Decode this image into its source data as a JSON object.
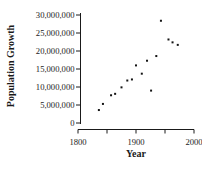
{
  "figure": {
    "background_color": "#ffffff",
    "axis_color": "#1a1a1a",
    "point_color": "#141414"
  },
  "chart_data": {
    "type": "scatter",
    "title": "",
    "xlabel": "Year",
    "ylabel": "Population Growth",
    "xlim": [
      1800,
      2000
    ],
    "ylim": [
      0,
      30000000
    ],
    "grid": false,
    "legend": false,
    "y_ticks": [
      {
        "value": 0,
        "label": "0"
      },
      {
        "value": 5000000,
        "label": "5,000,000"
      },
      {
        "value": 10000000,
        "label": "10,000,000"
      },
      {
        "value": 15000000,
        "label": "15,000,000"
      },
      {
        "value": 20000000,
        "label": "20,000,000"
      },
      {
        "value": 25000000,
        "label": "25,000,000"
      },
      {
        "value": 30000000,
        "label": "30,000,000"
      }
    ],
    "x_ticks": [
      {
        "year": 1800,
        "label": "1800"
      },
      {
        "year": 1850,
        "label": ""
      },
      {
        "year": 1900,
        "label": "1900"
      },
      {
        "year": 1950,
        "label": ""
      },
      {
        "year": 2000,
        "label": "2000"
      }
    ],
    "points": [
      {
        "year": 1836,
        "value": 3600000
      },
      {
        "year": 1843,
        "value": 5300000
      },
      {
        "year": 1857,
        "value": 7700000
      },
      {
        "year": 1864,
        "value": 8100000
      },
      {
        "year": 1875,
        "value": 9900000
      },
      {
        "year": 1885,
        "value": 11800000
      },
      {
        "year": 1893,
        "value": 12100000
      },
      {
        "year": 1900,
        "value": 16000000
      },
      {
        "year": 1910,
        "value": 13700000
      },
      {
        "year": 1919,
        "value": 17300000
      },
      {
        "year": 1926,
        "value": 9000000
      },
      {
        "year": 1935,
        "value": 18600000
      },
      {
        "year": 1943,
        "value": 28400000
      },
      {
        "year": 1956,
        "value": 23200000
      },
      {
        "year": 1963,
        "value": 22400000
      },
      {
        "year": 1972,
        "value": 21700000
      }
    ]
  }
}
